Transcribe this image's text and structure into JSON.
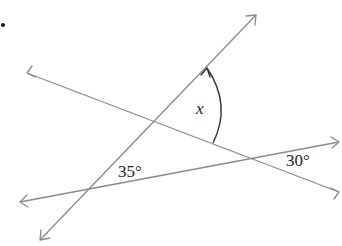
{
  "diagram": {
    "type": "intersecting-lines-angle-problem",
    "colors": {
      "line": "#8a8a8a",
      "arc": "#333333",
      "text": "#222222"
    },
    "lines": [
      {
        "id": "line-a",
        "description": "steep line rising left-to-right",
        "x1": 40,
        "y1": 240,
        "x2": 256,
        "y2": 15
      },
      {
        "id": "line-b",
        "description": "line descending left-to-right",
        "x1": 27,
        "y1": 73,
        "x2": 339,
        "y2": 192
      },
      {
        "id": "line-c",
        "description": "shallow line rising left-to-right",
        "x1": 20,
        "y1": 202,
        "x2": 339,
        "y2": 142
      }
    ],
    "labels": {
      "unknown_angle": "x",
      "angle_1": "35°",
      "angle_2": "30°"
    },
    "angles": [
      {
        "label": "x",
        "meaning": "unknown angle between line A and line B (marked by arc with arrow)"
      },
      {
        "label": "35°",
        "meaning": "angle between line A and line C"
      },
      {
        "label": "30°",
        "meaning": "angle between line B and line C"
      }
    ]
  }
}
